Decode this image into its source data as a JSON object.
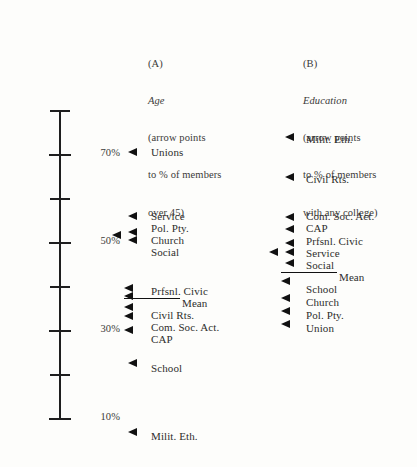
{
  "figure": {
    "title_present": false,
    "background": "#fdfdfb",
    "ink": "#1e1e1e"
  },
  "axis": {
    "unit": "%",
    "orientation": "vertical",
    "min": 10,
    "max": 80,
    "tick_step": 10,
    "ticks": [
      {
        "value": 80,
        "label": "",
        "y": 110
      },
      {
        "value": 70,
        "label": "70%",
        "y": 154
      },
      {
        "value": 60,
        "label": "",
        "y": 198
      },
      {
        "value": 50,
        "label": "50%",
        "y": 242
      },
      {
        "value": 40,
        "label": "",
        "y": 286
      },
      {
        "value": 30,
        "label": "30%",
        "y": 330
      },
      {
        "value": 20,
        "label": "",
        "y": 374
      },
      {
        "value": 10,
        "label": "10%",
        "y": 418
      }
    ]
  },
  "columns": [
    {
      "key": "(A)",
      "variable": "Age",
      "note_lines": [
        "(arrow points",
        "to % of members",
        "over 45)"
      ],
      "caption_x": 148,
      "caption_y": 33,
      "arrow_x": 128,
      "label_x": 151,
      "markers": [
        {
          "name": "Unions",
          "label": "Unions",
          "arrow_x": 128,
          "arrow_y": 152,
          "label_y": 147,
          "mean_rule": false
        },
        {
          "name": "Service",
          "label": "Service",
          "arrow_x": 128,
          "arrow_y": 216,
          "label_y": 211,
          "mean_rule": false
        },
        {
          "name": "Pol. Pty.",
          "label": "Pol. Pty.",
          "arrow_x": 112,
          "arrow_y": 235,
          "label_y": 223,
          "mean_rule": false
        },
        {
          "name": "Church",
          "label": "Church",
          "arrow_x": 128,
          "arrow_y": 232,
          "label_y": 235,
          "mean_rule": false
        },
        {
          "name": "Social",
          "label": "Social",
          "arrow_x": 128,
          "arrow_y": 240,
          "label_y": 247,
          "mean_rule": false
        },
        {
          "name": "Prfsnl. Civic",
          "label": "Prfsnl. Civic",
          "arrow_x": 124,
          "arrow_y": 288,
          "label_y": 286,
          "mean_rule": false
        },
        {
          "name": "Mean",
          "label": "Mean",
          "arrow_x": 124,
          "arrow_y": 296,
          "label_y": 298,
          "mean_rule": true,
          "rule_x": 124,
          "rule_w": 56,
          "rule_y": 298,
          "label_x": 182
        },
        {
          "name": "Civil Rts.",
          "label": "Civil Rts.",
          "arrow_x": 124,
          "arrow_y": 307,
          "label_y": 310,
          "mean_rule": false
        },
        {
          "name": "Com. Soc. Act.",
          "label": "Com. Soc. Act.",
          "arrow_x": 124,
          "arrow_y": 316,
          "label_y": 322,
          "mean_rule": false
        },
        {
          "name": "CAP",
          "label": "CAP",
          "arrow_x": 124,
          "arrow_y": 330,
          "label_y": 334,
          "mean_rule": false
        },
        {
          "name": "School",
          "label": "School",
          "arrow_x": 128,
          "arrow_y": 363,
          "label_y": 363,
          "mean_rule": false
        },
        {
          "name": "Milit. Eth.",
          "label": "Milit. Eth.",
          "arrow_x": 128,
          "arrow_y": 432,
          "label_y": 431,
          "mean_rule": false
        }
      ]
    },
    {
      "key": "(B)",
      "variable": "Education",
      "note_lines": [
        "(arrow points",
        "to % of members",
        "with any college)"
      ],
      "caption_x": 303,
      "caption_y": 33,
      "arrow_x": 285,
      "label_x": 306,
      "markers": [
        {
          "name": "Milit. Eth.",
          "label": "Milit. Eth.",
          "arrow_x": 285,
          "arrow_y": 137,
          "label_y": 134,
          "mean_rule": false
        },
        {
          "name": "Civil Rts.",
          "label": "Civil Rts.",
          "arrow_x": 285,
          "arrow_y": 177,
          "label_y": 174,
          "mean_rule": false
        },
        {
          "name": "Com. Soc. Act.",
          "label": "Com. Soc. Act.",
          "arrow_x": 285,
          "arrow_y": 217,
          "label_y": 211,
          "mean_rule": false
        },
        {
          "name": "CAP",
          "label": "CAP",
          "arrow_x": 285,
          "arrow_y": 229,
          "label_y": 223,
          "mean_rule": false
        },
        {
          "name": "Prfsnl. Civic",
          "label": "Prfsnl. Civic",
          "arrow_x": 285,
          "arrow_y": 243,
          "label_y": 236,
          "mean_rule": false
        },
        {
          "name": "Service",
          "label": "Service",
          "arrow_x": 269,
          "arrow_y": 252,
          "label_y": 248,
          "mean_rule": false
        },
        {
          "name": "Social",
          "label": "Social",
          "arrow_x": 285,
          "arrow_y": 252,
          "label_y": 260,
          "mean_rule": false
        },
        {
          "name": "Mean",
          "label": "Mean",
          "arrow_x": 285,
          "arrow_y": 263,
          "label_y": 272,
          "mean_rule": true,
          "rule_x": 281,
          "rule_w": 56,
          "rule_y": 272,
          "label_x": 339
        },
        {
          "name": "School",
          "label": "School",
          "arrow_x": 281,
          "arrow_y": 281,
          "label_y": 284,
          "mean_rule": false
        },
        {
          "name": "Church",
          "label": "Church",
          "arrow_x": 281,
          "arrow_y": 298,
          "label_y": 297,
          "mean_rule": false
        },
        {
          "name": "Pol. Pty.",
          "label": "Pol. Pty.",
          "arrow_x": 281,
          "arrow_y": 311,
          "label_y": 310,
          "mean_rule": false
        },
        {
          "name": "Union",
          "label": "Union",
          "arrow_x": 281,
          "arrow_y": 324,
          "label_y": 323,
          "mean_rule": false
        }
      ]
    }
  ],
  "chart_data": {
    "type": "scatter",
    "title": "",
    "subtitle": "",
    "xlabel": "",
    "ylabel": "%",
    "ylim": [
      10,
      80
    ],
    "yticks": [
      10,
      20,
      30,
      40,
      50,
      60,
      70,
      80
    ],
    "ytick_labels": [
      "10%",
      "",
      "30%",
      "",
      "50%",
      "",
      "70%",
      ""
    ],
    "grid": false,
    "legend": "none",
    "orientation": "vertical-dotplot",
    "panels": [
      {
        "key": "(A)",
        "name": "Age",
        "annotation": "(arrow points to % of members over 45)",
        "categories": [
          "Unions",
          "Service",
          "Pol. Pty.",
          "Church",
          "Social",
          "Prfsnl. Civic",
          "Mean",
          "Civil Rts.",
          "Com. Soc. Act.",
          "CAP",
          "School",
          "Milit. Eth."
        ],
        "values": [
          70,
          55,
          50,
          48,
          46,
          35,
          34,
          32,
          30,
          27,
          23,
          7
        ]
      },
      {
        "key": "(B)",
        "name": "Education",
        "annotation": "(arrow points to % of members with any college)",
        "categories": [
          "Milit. Eth.",
          "Civil Rts.",
          "Com. Soc. Act.",
          "CAP",
          "Prfsnl. Civic",
          "Service",
          "Social",
          "Mean",
          "School",
          "Church",
          "Pol. Pty.",
          "Union"
        ],
        "values": [
          74,
          65,
          56,
          53,
          50,
          48,
          48,
          45,
          41,
          37,
          34,
          31
        ]
      }
    ]
  }
}
